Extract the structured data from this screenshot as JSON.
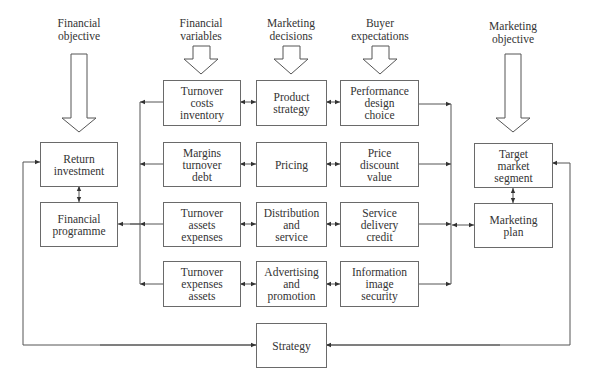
{
  "headers": {
    "financial_objective": "Financial\nobjective",
    "financial_variables": "Financial\nvariables",
    "marketing_decisions": "Marketing\ndecisions",
    "buyer_expectations": "Buyer\nexpectations",
    "marketing_objective": "Marketing\nobjective"
  },
  "left": {
    "return_investment": "Return\ninvestment",
    "financial_programme": "Financial\nprogramme"
  },
  "financial_variables": [
    "Turnover\ncosts\ninventory",
    "Margins\nturnover\ndebt",
    "Turnover\nassets\nexpenses",
    "Turnover\nexpenses\nassets"
  ],
  "marketing_decisions": [
    "Product\nstrategy",
    "Pricing",
    "Distribution\nand\nservice",
    "Advertising\nand\npromotion"
  ],
  "buyer_expectations": [
    "Performance\ndesign\nchoice",
    "Price\ndiscount\nvalue",
    "Service\ndelivery\ncredit",
    "Information\nimage\nsecurity"
  ],
  "right": {
    "target_market_segment": "Target\nmarket\nsegment",
    "marketing_plan": "Marketing\nplan"
  },
  "bottom": {
    "strategy": "Strategy"
  }
}
